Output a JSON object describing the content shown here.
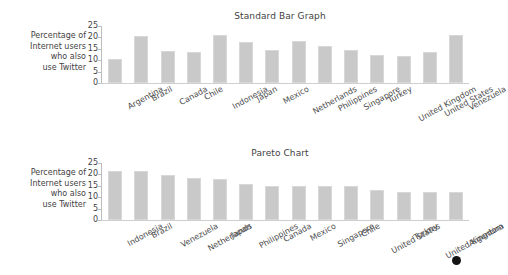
{
  "page": {
    "background": "#ffffff",
    "bar_color": "#c9c9c9",
    "axis_color": "#bdbdbd",
    "text_color": "#3f3f3f"
  },
  "axis_caption": {
    "line1": "Percentage of",
    "line2": "Internet users",
    "line3": "who also",
    "line4": "use Twitter"
  },
  "y_ticks": [
    "25",
    "20",
    "15",
    "10",
    "5",
    "0"
  ],
  "cursor": {
    "name": "mouse-cursor-dot",
    "x": 456,
    "y": 260,
    "color": "#141414"
  },
  "chart_data": [
    {
      "id": "standard-bar-graph",
      "type": "bar",
      "title": "Standard Bar Graph",
      "xlabel": "",
      "ylabel": "Percentage of Internet users who also use Twitter",
      "ylim": [
        0,
        25
      ],
      "yticks": [
        0,
        5,
        10,
        15,
        20,
        25
      ],
      "grid": false,
      "legend": false,
      "categories": [
        "Argentina",
        "Brazil",
        "Canada",
        "Chile",
        "Indonesia",
        "Japan",
        "Mexico",
        "Netherlands",
        "Philippines",
        "Singapore",
        "Turkey",
        "United Kingdom",
        "United States",
        "Venezuela"
      ],
      "values": [
        10.5,
        20.6,
        14.1,
        13.8,
        21.0,
        17.9,
        14.4,
        18.6,
        16.2,
        14.6,
        12.2,
        12.0,
        13.6,
        20.9
      ]
    },
    {
      "id": "pareto-chart",
      "type": "bar",
      "title": "Pareto Chart",
      "xlabel": "",
      "ylabel": "Percentage of Internet users who also use Twitter",
      "ylim": [
        0,
        25
      ],
      "yticks": [
        0,
        5,
        10,
        15,
        20,
        25
      ],
      "grid": false,
      "legend": false,
      "categories": [
        "Indonesia",
        "Brazil",
        "Venezuela",
        "Netherlands",
        "Japan",
        "Philippines",
        "Canada",
        "Mexico",
        "Singapore",
        "Chile",
        "United States",
        "Turkey",
        "United Kingdom",
        "Argentina"
      ],
      "values": [
        21.6,
        21.6,
        19.7,
        18.5,
        17.8,
        15.7,
        14.7,
        14.7,
        14.7,
        14.7,
        13.3,
        12.5,
        12.4,
        12.4
      ]
    }
  ]
}
